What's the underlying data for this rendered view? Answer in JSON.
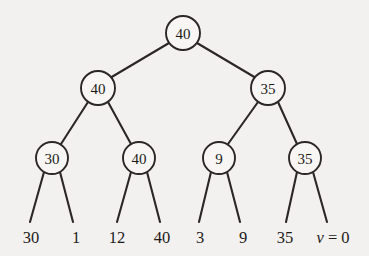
{
  "figure": {
    "background_color": "#f3f1ef",
    "stroke_color": "#2b2724",
    "node_fill_color": "#f7f6f4"
  },
  "tree": {
    "levels": [
      {
        "level": 0,
        "nodes": [
          {
            "id": "root",
            "label": "40",
            "cx": 183,
            "cy": 33,
            "r": 17
          }
        ]
      },
      {
        "level": 1,
        "nodes": [
          {
            "id": "n-l",
            "label": "40",
            "cx": 98,
            "cy": 88,
            "r": 17
          },
          {
            "id": "n-r",
            "label": "35",
            "cx": 268,
            "cy": 88,
            "r": 17
          }
        ]
      },
      {
        "level": 2,
        "nodes": [
          {
            "id": "n-ll",
            "label": "30",
            "cx": 52,
            "cy": 158,
            "r": 16
          },
          {
            "id": "n-lr",
            "label": "40",
            "cx": 139,
            "cy": 158,
            "r": 16
          },
          {
            "id": "n-rl",
            "label": "9",
            "cx": 219,
            "cy": 158,
            "r": 16
          },
          {
            "id": "n-rr",
            "label": "35",
            "cx": 305,
            "cy": 158,
            "r": 16
          }
        ]
      }
    ],
    "edges": [
      {
        "from": "root",
        "to": "n-l",
        "x1": 169,
        "y1": 43,
        "x2": 110,
        "y2": 78
      },
      {
        "from": "root",
        "to": "n-r",
        "x1": 197,
        "y1": 43,
        "x2": 256,
        "y2": 78
      },
      {
        "from": "n-l",
        "to": "n-ll",
        "x1": 88,
        "y1": 102,
        "x2": 61,
        "y2": 144
      },
      {
        "from": "n-l",
        "to": "n-lr",
        "x1": 108,
        "y1": 102,
        "x2": 131,
        "y2": 144
      },
      {
        "from": "n-r",
        "to": "n-rl",
        "x1": 258,
        "y1": 102,
        "x2": 228,
        "y2": 144
      },
      {
        "from": "n-r",
        "to": "n-rr",
        "x1": 278,
        "y1": 102,
        "x2": 297,
        "y2": 144
      },
      {
        "from": "n-ll",
        "to": "leaf0",
        "x1": 44,
        "y1": 172,
        "x2": 30,
        "y2": 222
      },
      {
        "from": "n-ll",
        "to": "leaf1",
        "x1": 60,
        "y1": 172,
        "x2": 73,
        "y2": 222
      },
      {
        "from": "n-lr",
        "to": "leaf2",
        "x1": 131,
        "y1": 172,
        "x2": 117,
        "y2": 222
      },
      {
        "from": "n-lr",
        "to": "leaf3",
        "x1": 147,
        "y1": 172,
        "x2": 160,
        "y2": 222
      },
      {
        "from": "n-rl",
        "to": "leaf4",
        "x1": 211,
        "y1": 172,
        "x2": 199,
        "y2": 222
      },
      {
        "from": "n-rl",
        "to": "leaf5",
        "x1": 227,
        "y1": 172,
        "x2": 240,
        "y2": 222
      },
      {
        "from": "n-rr",
        "to": "leaf6",
        "x1": 297,
        "y1": 172,
        "x2": 286,
        "y2": 222
      },
      {
        "from": "n-rr",
        "to": "leaf7",
        "x1": 313,
        "y1": 172,
        "x2": 327,
        "y2": 222
      }
    ],
    "leaves": [
      {
        "id": "leaf0",
        "label": "30",
        "x": 31,
        "y": 243
      },
      {
        "id": "leaf1",
        "label": "1",
        "x": 76,
        "y": 243
      },
      {
        "id": "leaf2",
        "label": "12",
        "x": 117,
        "y": 243
      },
      {
        "id": "leaf3",
        "label": "40",
        "x": 162,
        "y": 243
      },
      {
        "id": "leaf4",
        "label": "3",
        "x": 200,
        "y": 243
      },
      {
        "id": "leaf5",
        "label": "9",
        "x": 243,
        "y": 243
      },
      {
        "id": "leaf6",
        "label": "35",
        "x": 285,
        "y": 243
      },
      {
        "id": "leaf7",
        "label": "v = 0",
        "x": 333,
        "y": 243,
        "italic_prefix": "v",
        "rest": " = 0"
      }
    ]
  }
}
